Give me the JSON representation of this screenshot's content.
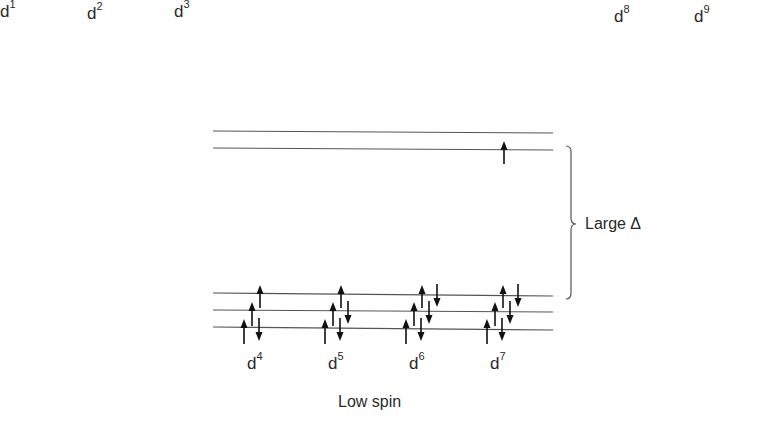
{
  "top_row_labels": [
    {
      "base": "d",
      "sup": "1",
      "x": 0
    },
    {
      "base": "d",
      "sup": "2",
      "x": 87
    },
    {
      "base": "d",
      "sup": "3",
      "x": 174
    },
    {
      "base": "d",
      "sup": "8",
      "x": 614
    },
    {
      "base": "d",
      "sup": "9",
      "x": 694
    }
  ],
  "diagram": {
    "energy_levels": {
      "eg_y": [
        131,
        149
      ],
      "t2g_y": [
        294,
        311,
        328
      ],
      "x_start": 213,
      "x_end": 553
    },
    "gap_label": "Large Δ",
    "configurations": [
      {
        "base": "d",
        "sup": "4",
        "label_x": 247
      },
      {
        "base": "d",
        "sup": "5",
        "label_x": 328
      },
      {
        "base": "d",
        "sup": "6",
        "label_x": 409
      },
      {
        "base": "d",
        "sup": "7",
        "label_x": 490
      }
    ],
    "caption": "Low spin"
  },
  "colors": {
    "line": "#555555",
    "arrow": "#111111",
    "text": "#2a2a2a"
  }
}
